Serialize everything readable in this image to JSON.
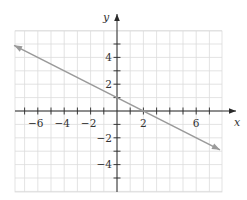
{
  "chart_data": {
    "type": "line",
    "title": "",
    "xlabel": "x",
    "ylabel": "y",
    "xlim": [
      -7.8,
      7.8
    ],
    "ylim": [
      -6,
      6
    ],
    "grid": true,
    "x_ticks": [
      -7,
      -6,
      -5,
      -4,
      -3,
      -2,
      -1,
      1,
      2,
      3,
      4,
      5,
      6,
      7
    ],
    "y_ticks": [
      -5,
      -4,
      -3,
      -2,
      -1,
      1,
      2,
      3,
      4,
      5
    ],
    "x_tick_labels": [
      "−6",
      "−4",
      "−2",
      "2",
      "6"
    ],
    "x_tick_label_values": [
      -6,
      -4,
      -2,
      2,
      6
    ],
    "y_tick_labels": [
      "4",
      "2",
      "−2",
      "−4"
    ],
    "y_tick_label_values": [
      4,
      2,
      -2,
      -4
    ],
    "series": [
      {
        "name": "y = -x/2 + 1",
        "equation": "y = -0.5x + 1",
        "x": [
          -7.8,
          0,
          2,
          7.8
        ],
        "y": [
          4.9,
          1,
          0,
          -2.9
        ],
        "arrows": "both",
        "color": "#9a9a9a"
      }
    ],
    "legend": null
  },
  "colors": {
    "grid": "#dcdcdc",
    "axis": "#2a2a2a",
    "line": "#9a9a9a",
    "text": "#333333"
  }
}
